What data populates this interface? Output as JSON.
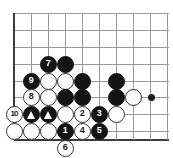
{
  "diagram": {
    "kind": "go-board-problem",
    "board": {
      "line_color": "#9a9a9a",
      "edge_color": "#3b3b3b",
      "background": "#ffffff",
      "spacing_px": 17,
      "origin": {
        "x": 14,
        "y": 13
      },
      "columns_x": [
        14,
        31,
        48,
        65,
        82,
        99,
        116,
        133,
        150,
        167
      ],
      "rows_y": [
        13,
        30,
        47,
        64,
        81,
        97,
        114,
        131,
        140
      ],
      "left_edge_x": 14,
      "bottom_edge_y": 140,
      "hoshi": [
        {
          "x": 151,
          "y": 97
        }
      ]
    },
    "stone_colors": {
      "black": "#141414",
      "white": "#ffffff",
      "white_outline": "#333333",
      "black_label": "#ffffff",
      "white_label": "#222222",
      "triangle_mark": "#ffffff"
    },
    "stones": [
      {
        "id": "s-b-c3r4",
        "color": "black",
        "label": "7",
        "x": 48,
        "y": 64
      },
      {
        "id": "s-b-c4r4",
        "color": "black",
        "label": "",
        "x": 65,
        "y": 64
      },
      {
        "id": "s-b-c2r5",
        "color": "black",
        "label": "9",
        "x": 31,
        "y": 81
      },
      {
        "id": "s-w-c3r5",
        "color": "white",
        "label": "",
        "x": 48,
        "y": 81
      },
      {
        "id": "s-w-c4r5",
        "color": "white",
        "label": "",
        "x": 65,
        "y": 81
      },
      {
        "id": "s-b-c5r5",
        "color": "black",
        "label": "",
        "x": 82,
        "y": 81
      },
      {
        "id": "s-b-c7r5",
        "color": "black",
        "label": "",
        "x": 116,
        "y": 81
      },
      {
        "id": "s-w-c2r6",
        "color": "white",
        "label": "8",
        "x": 31,
        "y": 97
      },
      {
        "id": "s-w-c3r6",
        "color": "white",
        "label": "",
        "x": 48,
        "y": 97
      },
      {
        "id": "s-b-c4r6",
        "color": "black",
        "label": "",
        "x": 65,
        "y": 97
      },
      {
        "id": "s-b-c5r6",
        "color": "black",
        "label": "",
        "x": 82,
        "y": 97
      },
      {
        "id": "s-b-c7r6",
        "color": "black",
        "label": "",
        "x": 116,
        "y": 97
      },
      {
        "id": "s-w-c8r6",
        "color": "white",
        "label": "",
        "x": 133,
        "y": 97
      },
      {
        "id": "s-w-c1r7",
        "color": "white",
        "label": "10",
        "x": 14,
        "y": 114
      },
      {
        "id": "s-b-c2r7",
        "color": "black",
        "label": "",
        "x": 31,
        "y": 114,
        "mark": "triangle"
      },
      {
        "id": "s-b-c3r7",
        "color": "black",
        "label": "",
        "x": 48,
        "y": 114,
        "mark": "triangle"
      },
      {
        "id": "s-w-c4r7",
        "color": "white",
        "label": "",
        "x": 65,
        "y": 114
      },
      {
        "id": "s-w-c5r7",
        "color": "white",
        "label": "2",
        "x": 82,
        "y": 114
      },
      {
        "id": "s-b-c6r7",
        "color": "black",
        "label": "3",
        "x": 99,
        "y": 114
      },
      {
        "id": "s-w-c7r7",
        "color": "white",
        "label": "",
        "x": 116,
        "y": 114
      },
      {
        "id": "s-w-c1r8",
        "color": "white",
        "label": "",
        "x": 14,
        "y": 131
      },
      {
        "id": "s-w-c2r8",
        "color": "white",
        "label": "",
        "x": 31,
        "y": 131
      },
      {
        "id": "s-w-c3r8",
        "color": "white",
        "label": "",
        "x": 48,
        "y": 131
      },
      {
        "id": "s-b-c4r8",
        "color": "black",
        "label": "1",
        "x": 65,
        "y": 131
      },
      {
        "id": "s-w-c5r8",
        "color": "white",
        "label": "4",
        "x": 82,
        "y": 131
      },
      {
        "id": "s-b-c6r8",
        "color": "black",
        "label": "5",
        "x": 99,
        "y": 131
      },
      {
        "id": "s-w-off-6",
        "color": "white",
        "label": "6",
        "x": 65,
        "y": 148
      }
    ]
  }
}
